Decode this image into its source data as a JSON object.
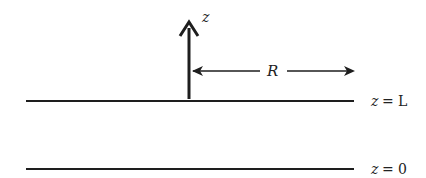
{
  "diagram": {
    "axis_label": "z",
    "distance_label": "R",
    "planes": [
      {
        "label": "z = L",
        "lhs": "z",
        "eq": "=",
        "rhs": "L",
        "y": 101
      },
      {
        "label": "z = 0",
        "lhs": "z",
        "eq": "=",
        "rhs": "0",
        "y": 169
      }
    ],
    "colors": {
      "stroke": "#1e1e1e",
      "text": "#222222",
      "background": "#ffffff"
    }
  }
}
